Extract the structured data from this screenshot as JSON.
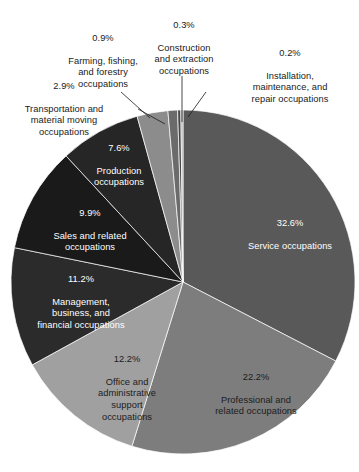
{
  "chart_data": {
    "type": "pie",
    "title": "",
    "subtitle": "",
    "xlabel": "",
    "ylabel": "",
    "legend_position": "none",
    "grid": false,
    "unit": "%",
    "total": 100.0,
    "start_angle_deg": 0,
    "direction": "clockwise",
    "categories": [
      "Service occupations",
      "Professional and related occupations",
      "Office and administrative support occupations",
      "Management, business, and financial occupations",
      "Sales and related occupations",
      "Production occupations",
      "Transportation and material moving occupations",
      "Farming, fishing, and forestry occupations",
      "Construction and extraction occupations",
      "Installation, maintenance, and repair occupations"
    ],
    "values": [
      32.6,
      22.2,
      12.2,
      11.2,
      9.9,
      7.6,
      2.9,
      0.9,
      0.3,
      0.2
    ],
    "colors": [
      "#595959",
      "#7d7d7d",
      "#a0a0a0",
      "#2b2b2b",
      "#1a1a1a",
      "#262626",
      "#8c8c8c",
      "#6b6b6b",
      "#474747",
      "#b3b3b3"
    ],
    "slices": [
      {
        "id": "service",
        "name": "Service occupations",
        "percent_text": "32.6%",
        "value": 32.6,
        "color": "#595959",
        "label_placement": "inside",
        "label_color": "#ffffff"
      },
      {
        "id": "professional",
        "name": "Professional and\nrelated occupations",
        "percent_text": "22.2%",
        "value": 22.2,
        "color": "#7d7d7d",
        "label_placement": "inside",
        "label_color": "#1c1c1c"
      },
      {
        "id": "office-admin",
        "name": "Office and\nadministrative\nsupport\noccupations",
        "percent_text": "12.2%",
        "value": 12.2,
        "color": "#a0a0a0",
        "label_placement": "inside",
        "label_color": "#1c1c1c"
      },
      {
        "id": "management",
        "name": "Management,\nbusiness, and\nfinancial occupations",
        "percent_text": "11.2%",
        "value": 11.2,
        "color": "#2b2b2b",
        "label_placement": "inside",
        "label_color": "#ffffff"
      },
      {
        "id": "sales",
        "name": "Sales and related\noccupations",
        "percent_text": "9.9%",
        "value": 9.9,
        "color": "#1a1a1a",
        "label_placement": "inside",
        "label_color": "#ffffff"
      },
      {
        "id": "production",
        "name": "Production\noccupations",
        "percent_text": "7.6%",
        "value": 7.6,
        "color": "#262626",
        "label_placement": "inside",
        "label_color": "#ffffff"
      },
      {
        "id": "transportation",
        "name": "Transportation and\nmaterial moving\noccupations",
        "percent_text": "2.9%",
        "value": 2.9,
        "color": "#8c8c8c",
        "label_placement": "outside",
        "label_color": "#1a1a1a"
      },
      {
        "id": "farming",
        "name": "Farming, fishing,\nand forestry\noccupations",
        "percent_text": "0.9%",
        "value": 0.9,
        "color": "#6b6b6b",
        "label_placement": "outside",
        "label_color": "#1a1a1a"
      },
      {
        "id": "construction",
        "name": "Construction\nand extraction\noccupations",
        "percent_text": "0.3%",
        "value": 0.3,
        "color": "#474747",
        "label_placement": "outside",
        "label_color": "#1a1a1a"
      },
      {
        "id": "installation",
        "name": "Installation,\nmaintenance, and\nrepair occupations",
        "percent_text": "0.2%",
        "value": 0.2,
        "color": "#b3b3b3",
        "label_placement": "outside",
        "label_color": "#1a1a1a"
      }
    ]
  },
  "labels": {
    "service": {
      "pct": "32.6%",
      "name": "Service occupations"
    },
    "professional": {
      "pct": "22.2%",
      "name": "Professional and\nrelated occupations"
    },
    "office_admin": {
      "pct": "12.2%",
      "name": "Office and\nadministrative\nsupport\noccupations"
    },
    "management": {
      "pct": "11.2%",
      "name": "Management,\nbusiness, and\nfinancial occupations"
    },
    "sales": {
      "pct": "9.9%",
      "name": "Sales and related\noccupations"
    },
    "production": {
      "pct": "7.6%",
      "name": "Production\noccupations"
    },
    "transportation": {
      "pct": "2.9%",
      "name": "Transportation and\nmaterial moving\noccupations"
    },
    "farming": {
      "pct": "0.9%",
      "name": "Farming, fishing,\nand forestry\noccupations"
    },
    "construction": {
      "pct": "0.3%",
      "name": "Construction\nand extraction\noccupations"
    },
    "installation": {
      "pct": "0.2%",
      "name": "Installation,\nmaintenance, and\nrepair occupations"
    }
  }
}
